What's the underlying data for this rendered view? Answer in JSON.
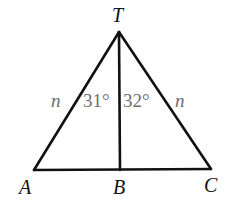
{
  "diagram": {
    "type": "triangle",
    "vertices": {
      "T": {
        "label": "T",
        "x": 119,
        "y": 32
      },
      "A": {
        "label": "A",
        "x": 34,
        "y": 170
      },
      "B": {
        "label": "B",
        "x": 120,
        "y": 170
      },
      "C": {
        "label": "C",
        "x": 211,
        "y": 169
      }
    },
    "segments": [
      "TA",
      "TC",
      "AC",
      "TB"
    ],
    "side_labels": {
      "TA": "n",
      "TC": "n"
    },
    "angle_labels": {
      "ATB": "31°",
      "BTC": "32°"
    },
    "colors": {
      "line": "#111111",
      "vertex_label": "#111111",
      "annotation": "#6e6e6e",
      "background": "#ffffff"
    }
  }
}
